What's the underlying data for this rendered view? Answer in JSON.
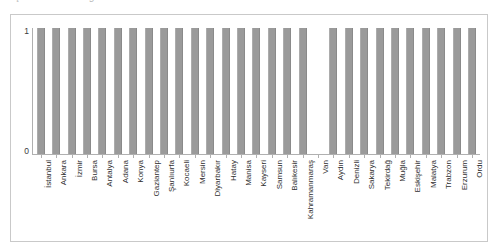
{
  "clipped_caption": "Şekil 4. Nüfusa göre iller",
  "chart_data": {
    "type": "bar",
    "title": "",
    "xlabel": "",
    "ylabel": "",
    "ylim": [
      0,
      1
    ],
    "yticks": [
      "0",
      "1"
    ],
    "grid": false,
    "legend": "none",
    "bar_color": "#9a9a9a",
    "categories": [
      "İstanbul",
      "Ankara",
      "İzmir",
      "Bursa",
      "Antalya",
      "Adana",
      "Konya",
      "Gaziantep",
      "Şanlıurfa",
      "Kocaeli",
      "Mersin",
      "Diyarbakır",
      "Hatay",
      "Manisa",
      "Kayseri",
      "Samsun",
      "Balıkesir",
      "Kahramanmaraş",
      "Van",
      "Aydın",
      "Denizli",
      "Sakarya",
      "Tekirdağ",
      "Muğla",
      "Eskişehir",
      "Malatya",
      "Trabzon",
      "Erzurum",
      "Ordu"
    ],
    "values": [
      1,
      1,
      1,
      1,
      1,
      1,
      1,
      1,
      1,
      1,
      1,
      1,
      1,
      1,
      1,
      1,
      1,
      1,
      0,
      1,
      1,
      1,
      1,
      1,
      1,
      1,
      1,
      1,
      1
    ]
  }
}
